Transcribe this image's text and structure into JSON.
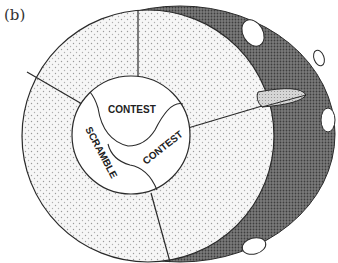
{
  "panel_label": "(b)",
  "regions": {
    "center_labels": [
      {
        "id": "contest-top",
        "text": "CONTEST"
      },
      {
        "id": "contest-right",
        "text": "CONTEST"
      },
      {
        "id": "scramble",
        "text": "SCRAMBLE"
      }
    ]
  },
  "colors": {
    "background": "#ffffff",
    "outer_band": "#6b6b6b",
    "dotted_ring": "#f4f4f4",
    "dot": "#9a9a9a",
    "inner_core": "#ffffff",
    "line": "#2a2a2a",
    "lens": "#c8c8c8"
  }
}
